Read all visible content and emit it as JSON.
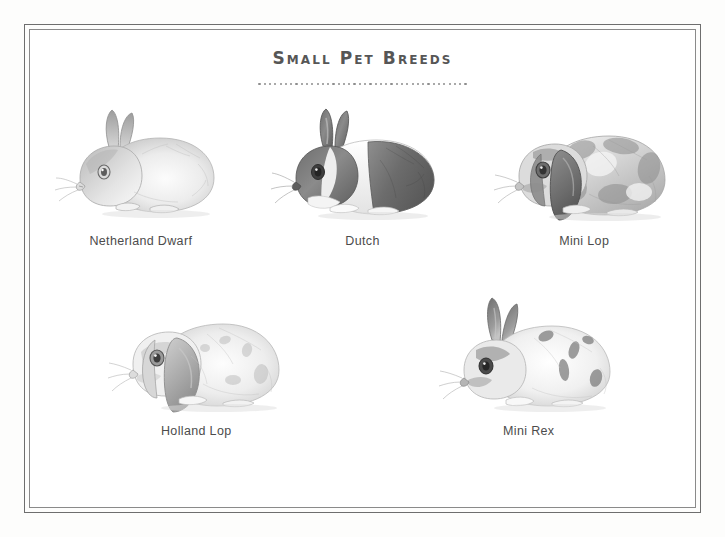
{
  "poster": {
    "title": "Small Pet Breeds",
    "divider_dot_count": 40,
    "title_color": "#565656",
    "label_color": "#4c4c4c",
    "frame_color": "#6e6e6e",
    "background_color": "#ffffff"
  },
  "breeds": [
    {
      "label": "Netherland Dwarf",
      "illustration": "netherland-dwarf-rabbit-sketch",
      "coat": "light gray-white with darker shaded face and ears",
      "ears": "upright",
      "row": 1
    },
    {
      "label": "Dutch",
      "illustration": "dutch-rabbit-sketch",
      "coat": "dark head and hindquarters with white shoulder band and white blaze",
      "ears": "upright",
      "row": 1
    },
    {
      "label": "Mini Lop",
      "illustration": "mini-lop-rabbit-sketch",
      "coat": "broken spotted gray and white",
      "ears": "lopped / drooping",
      "row": 1
    },
    {
      "label": "Holland Lop",
      "illustration": "holland-lop-rabbit-sketch",
      "coat": "light cream with soft gray spotting",
      "ears": "lopped / drooping",
      "row": 2
    },
    {
      "label": "Mini Rex",
      "illustration": "mini-rex-rabbit-sketch",
      "coat": "white with dark gray spots",
      "ears": "upright",
      "row": 2
    }
  ]
}
